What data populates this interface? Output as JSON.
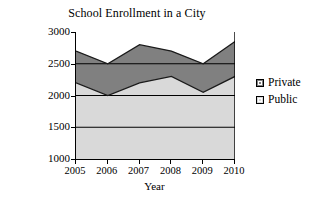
{
  "chart_data": {
    "type": "area",
    "stacked": true,
    "title": "School Enrollment in a City",
    "xlabel": "Year",
    "ylabel": "Number of Students",
    "categories": [
      "2005",
      "2006",
      "2007",
      "2008",
      "2009",
      "2010"
    ],
    "x": [
      2005,
      2006,
      2007,
      2008,
      2009,
      2010
    ],
    "ylim": [
      1000,
      3000
    ],
    "yticks": [
      1000,
      1500,
      2000,
      2500,
      3000
    ],
    "ytick_labels": [
      "1000",
      "1500",
      "2000",
      "2500",
      "3000"
    ],
    "grid": "horizontal",
    "legend_position": "right",
    "series": [
      {
        "name": "Public",
        "color": "#d9d9d9",
        "order": "bottom",
        "values": [
          2200,
          2000,
          2200,
          2300,
          2050,
          2300
        ],
        "cumulative": [
          2200,
          2000,
          2200,
          2300,
          2050,
          2300
        ]
      },
      {
        "name": "Private",
        "color": "#808080",
        "order": "top",
        "values": [
          500,
          500,
          600,
          400,
          450,
          550
        ],
        "cumulative": [
          2700,
          2500,
          2800,
          2700,
          2500,
          2850
        ]
      }
    ]
  },
  "legend": {
    "items": [
      {
        "label": "Private",
        "color": "#808080"
      },
      {
        "label": "Public",
        "color": "#d9d9d9"
      }
    ]
  },
  "axes": {
    "y_title": "Number of Students",
    "x_title": "Year"
  }
}
